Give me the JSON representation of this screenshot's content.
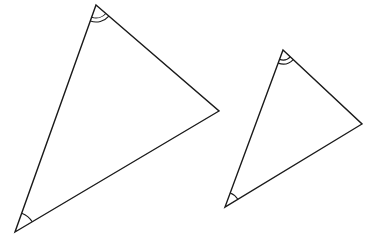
{
  "diagram": {
    "colors": {
      "background": "#ffffff",
      "stroke": "#1a1a1a"
    },
    "triangles": [
      {
        "id": "large-triangle",
        "vertices": {
          "top": [
            96,
            5
          ],
          "right": [
            219,
            111
          ],
          "bottom_left": [
            15,
            232
          ]
        },
        "angle_marks": [
          {
            "vertex": "top",
            "type": "double-arc",
            "radii": [
              13,
              17
            ]
          },
          {
            "vertex": "bottom_left",
            "type": "single-arc",
            "radius": 20
          }
        ]
      },
      {
        "id": "small-triangle",
        "vertices": {
          "top": [
            283,
            50
          ],
          "right": [
            362,
            124
          ],
          "bottom_left": [
            225,
            207
          ]
        },
        "angle_marks": [
          {
            "vertex": "top",
            "type": "double-arc",
            "radii": [
              10,
              14
            ]
          },
          {
            "vertex": "bottom_left",
            "type": "single-arc",
            "radius": 15
          }
        ]
      }
    ]
  }
}
